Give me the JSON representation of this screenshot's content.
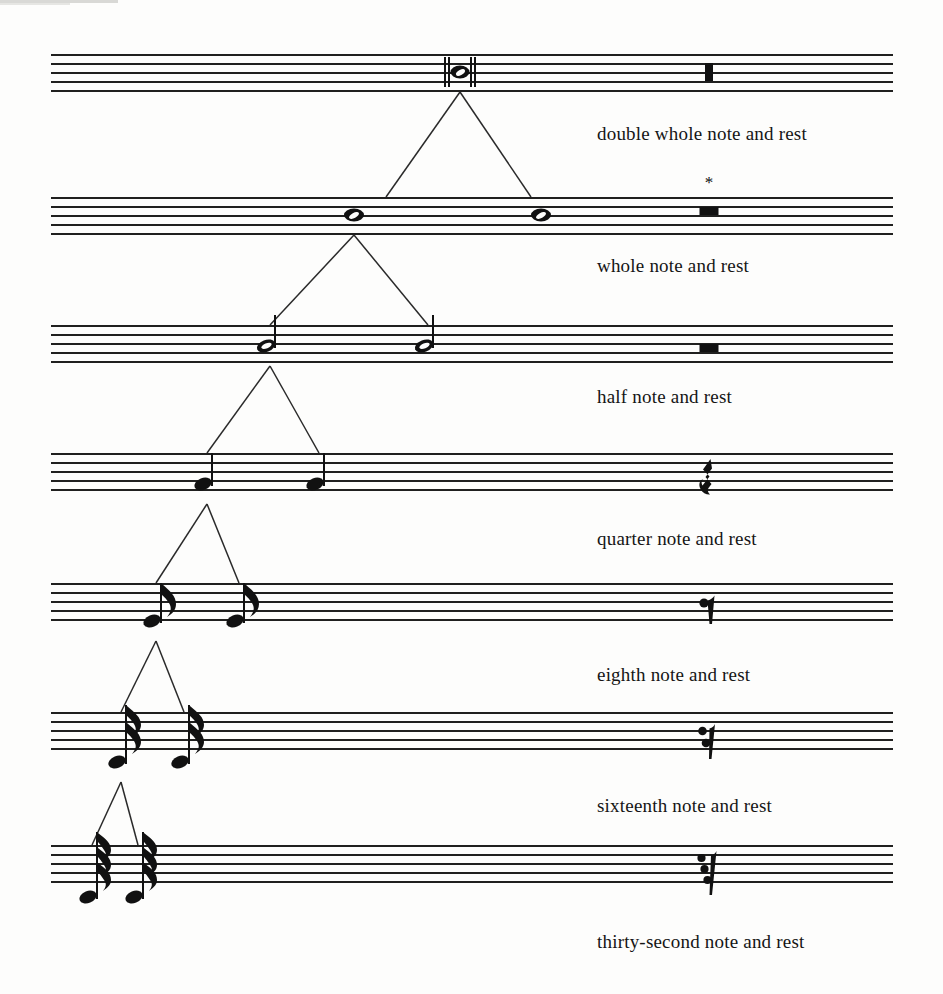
{
  "page": {
    "width": 943,
    "height": 994,
    "background": "#fdfdfc",
    "ink": "#111111"
  },
  "footnote_marker": "*",
  "systems": [
    {
      "id": "double-whole",
      "caption": "double whole note and rest",
      "staff_top": 54,
      "caption_x": 597,
      "caption_y": 134,
      "note_value": "double whole note",
      "rest_value": "double whole rest",
      "notes": [
        {
          "x": 460,
          "staff_pos": "middle-line",
          "y": 72
        }
      ],
      "rest": {
        "x": 709,
        "y": 63
      },
      "has_asterisk": false
    },
    {
      "id": "whole",
      "caption": "whole note and rest",
      "staff_top": 197,
      "caption_x": 597,
      "caption_y": 266,
      "note_value": "whole note",
      "rest_value": "whole rest",
      "notes": [
        {
          "x": 354,
          "y": 215
        },
        {
          "x": 541,
          "y": 215
        }
      ],
      "rest": {
        "x": 709,
        "y": 215
      },
      "has_asterisk": true,
      "asterisk_x": 709,
      "asterisk_y": 182
    },
    {
      "id": "half",
      "caption": "half note and rest",
      "staff_top": 325,
      "caption_x": 597,
      "caption_y": 397,
      "note_value": "half note",
      "rest_value": "half rest",
      "notes": [
        {
          "x": 266,
          "y": 346
        },
        {
          "x": 424,
          "y": 346
        }
      ],
      "rest": {
        "x": 709,
        "y": 343
      },
      "has_asterisk": false
    },
    {
      "id": "quarter",
      "caption": "quarter note and rest",
      "staff_top": 453,
      "caption_x": 597,
      "caption_y": 539,
      "note_value": "quarter note",
      "rest_value": "quarter rest",
      "notes": [
        {
          "x": 203,
          "y": 484
        },
        {
          "x": 315,
          "y": 484
        }
      ],
      "rest": {
        "x": 709,
        "y": 479
      },
      "has_asterisk": false
    },
    {
      "id": "eighth",
      "caption": "eighth note and rest",
      "staff_top": 583,
      "caption_x": 597,
      "caption_y": 675,
      "note_value": "eighth note",
      "rest_value": "eighth rest",
      "notes": [
        {
          "x": 152,
          "y": 621
        },
        {
          "x": 235,
          "y": 621
        }
      ],
      "rest": {
        "x": 709,
        "y": 612
      },
      "has_asterisk": false
    },
    {
      "id": "sixteenth",
      "caption": "sixteenth note and rest",
      "staff_top": 712,
      "caption_x": 597,
      "caption_y": 806,
      "note_value": "sixteenth note",
      "rest_value": "sixteenth rest",
      "notes": [
        {
          "x": 117,
          "y": 762
        },
        {
          "x": 180,
          "y": 762
        }
      ],
      "rest": {
        "x": 709,
        "y": 744
      },
      "has_asterisk": false
    },
    {
      "id": "thirty-second",
      "caption": "thirty-second note and rest",
      "staff_top": 845,
      "caption_x": 597,
      "caption_y": 942,
      "note_value": "thirty-second note",
      "rest_value": "thirty-second rest",
      "notes": [
        {
          "x": 88,
          "y": 897
        },
        {
          "x": 134,
          "y": 897
        }
      ],
      "rest": {
        "x": 709,
        "y": 876
      },
      "has_asterisk": false
    }
  ],
  "connectors": [
    {
      "from_x": 460,
      "from_y": 92,
      "to": [
        354,
        541
      ],
      "to_y": 197
    },
    {
      "from_x": 354,
      "from_y": 235,
      "to": [
        266,
        424
      ],
      "to_y": 325
    },
    {
      "from_x": 266,
      "from_y": 366,
      "to": [
        203,
        315
      ],
      "to_y": 453
    },
    {
      "from_x": 203,
      "from_y": 504,
      "to": [
        152,
        235
      ],
      "to_y": 583
    },
    {
      "from_x": 152,
      "from_y": 641,
      "to": [
        117,
        180
      ],
      "to_y": 712
    },
    {
      "from_x": 117,
      "from_y": 782,
      "to": [
        88,
        134
      ],
      "to_y": 845
    }
  ]
}
